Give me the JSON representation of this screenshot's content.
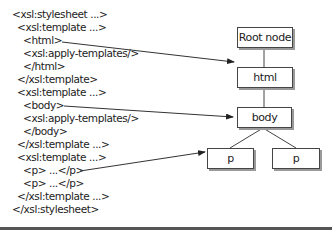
{
  "code_lines": [
    {
      "text": "<xsl:stylesheet ...>",
      "indent": 0
    },
    {
      "text": "<xsl:template ...>",
      "indent": 1
    },
    {
      "text": "<html>",
      "indent": 2
    },
    {
      "text": "<xsl:apply-templates/>",
      "indent": 2
    },
    {
      "text": "</html>",
      "indent": 2
    },
    {
      "text": "</xsl:template>",
      "indent": 1
    },
    {
      "text": "<xsl:template ...>",
      "indent": 1
    },
    {
      "text": "<body>",
      "indent": 2
    },
    {
      "text": "<xsl:apply-templates/>",
      "indent": 2
    },
    {
      "text": "</body>",
      "indent": 2
    },
    {
      "text": "</xsl:template ...>",
      "indent": 1
    },
    {
      "text": "<xsl:template ...>",
      "indent": 1
    },
    {
      "text": "<p> ...</p>",
      "indent": 2
    },
    {
      "text": "<p> ...</p>",
      "indent": 2
    },
    {
      "text": "</xsl:template ...>",
      "indent": 1
    },
    {
      "text": "</xsl:stylesheet>",
      "indent": 0
    }
  ],
  "tree": {
    "root": "Root node",
    "html": "html",
    "body": "body",
    "p1": "p",
    "p2": "p"
  }
}
